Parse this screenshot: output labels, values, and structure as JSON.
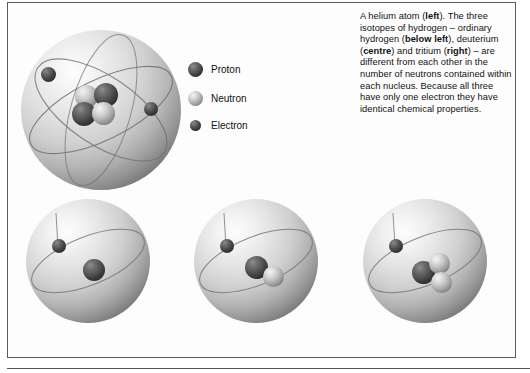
{
  "figure": {
    "caption_text": "A helium atom (left). The three isotopes of hydrogen – ordinary hydrogen (below left), deuterium (centre) and tritium (right) – are different from each other in the number of neutrons contained within each nucleus. Because all three have only one electron they have identical chemical properties.",
    "caption_segments": [
      {
        "text": "A helium atom (",
        "bold": false
      },
      {
        "text": "left",
        "bold": true
      },
      {
        "text": "). The three isotopes of hydrogen – ordinary hydrogen (",
        "bold": false
      },
      {
        "text": "below left",
        "bold": true
      },
      {
        "text": "), deuterium (",
        "bold": false
      },
      {
        "text": "centre",
        "bold": true
      },
      {
        "text": ") and tritium (",
        "bold": false
      },
      {
        "text": "right",
        "bold": true
      },
      {
        "text": ") – are different from each other in the number of neutrons contained within each nucleus. Because all three have only one electron they have identical chemical properties.",
        "bold": false
      }
    ]
  },
  "legend": {
    "items": [
      {
        "label": "Proton",
        "icon": "proton-sphere-icon",
        "color": "#3d3d3d",
        "size": 15
      },
      {
        "label": "Neutron",
        "icon": "neutron-sphere-icon",
        "color": "#a5a5a5",
        "size": 15
      },
      {
        "label": "Electron",
        "icon": "electron-sphere-icon",
        "color": "#343434",
        "size": 11
      }
    ]
  },
  "atoms": [
    {
      "id": "helium",
      "name": "helium-atom",
      "position_label": "left",
      "protons": 2,
      "neutrons": 2,
      "electrons": 2
    },
    {
      "id": "hydrogen",
      "name": "hydrogen-atom",
      "position_label": "below left",
      "protons": 1,
      "neutrons": 0,
      "electrons": 1
    },
    {
      "id": "deuterium",
      "name": "deuterium-atom",
      "position_label": "centre",
      "protons": 1,
      "neutrons": 1,
      "electrons": 1
    },
    {
      "id": "tritium",
      "name": "tritium-atom",
      "position_label": "right",
      "protons": 1,
      "neutrons": 2,
      "electrons": 1
    }
  ],
  "colors": {
    "frame_border": "#5b5b5b",
    "background": "#ffffff",
    "text": "#111111",
    "proton": "#3d3d3d",
    "neutron": "#a5a5a5",
    "electron": "#343434"
  }
}
